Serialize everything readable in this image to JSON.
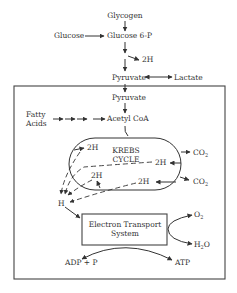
{
  "diagram": {
    "nodes": {
      "glycogen": "Glycogen",
      "glucose": "Glucose",
      "glucose6p": "Glucose 6-P",
      "twoH_glycolysis": "2H",
      "pyruvate_top": "Pyruvate",
      "lactate": "Lactate",
      "pyruvate_mito": "Pyruvate",
      "fatty_acids_line1": "Fatty",
      "fatty_acids_line2": "Acids",
      "acetyl_coa": "Acetyl CoA",
      "krebs_line1": "KREBS",
      "krebs_line2": "CYCLE",
      "twoH_a": "2H",
      "twoH_b": "2H",
      "twoH_c": "2H",
      "twoH_d": "2H",
      "co2_a": "CO",
      "co2_b": "CO",
      "co2_sub": "2",
      "h": "H",
      "ets_line1": "Electron Transport",
      "ets_line2": "System",
      "o2": "O",
      "o2_sub": "2",
      "h2o_a": "H",
      "h2o_sub": "2",
      "h2o_b": "O",
      "adp": "ADP + P",
      "atp": "ATP"
    }
  }
}
